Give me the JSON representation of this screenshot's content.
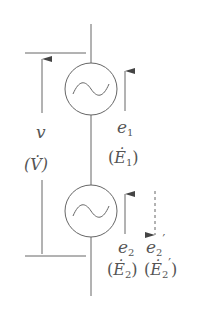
{
  "diagram": {
    "type": "circuit",
    "colors": {
      "line": "#666666",
      "text": "#555555",
      "background": "#ffffff"
    },
    "sources": [
      {
        "id": "source-1",
        "icon": "ac-source-icon",
        "label": "e1",
        "phasor": "(Ė1)"
      },
      {
        "id": "source-2",
        "icon": "ac-source-icon",
        "label": "e2",
        "phasor": "(Ė2)"
      }
    ],
    "labels": {
      "v": "v",
      "V_phasor": "(V̇)",
      "e1": "e",
      "e1_sub": "1",
      "E1_open": "(",
      "E1": "Ė",
      "E1_sub": "1",
      "E1_close": ")",
      "e2": "e",
      "e2_sub": "2",
      "E2_open": "(",
      "E2": "Ė",
      "E2_sub": "2",
      "E2_close": ")",
      "e2p": "e",
      "e2p_sub": "2",
      "e2p_prime": "′",
      "E2p_open": "(",
      "E2p": "Ė",
      "E2p_sub": "2",
      "E2p_prime": "′",
      "E2p_close": ")"
    },
    "arrows": [
      {
        "name": "v",
        "direction": "up",
        "style": "solid"
      },
      {
        "name": "e1",
        "direction": "up",
        "style": "solid"
      },
      {
        "name": "e2",
        "direction": "up",
        "style": "solid"
      },
      {
        "name": "e2-prime",
        "direction": "down",
        "style": "dashed"
      }
    ]
  }
}
